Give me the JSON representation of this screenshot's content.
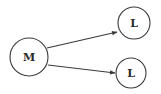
{
  "diagram": {
    "type": "directed-graph",
    "nodes": [
      {
        "id": "m",
        "label": "M",
        "cx": 29,
        "cy": 57,
        "r": 19
      },
      {
        "id": "l1",
        "label": "L",
        "cx": 134,
        "cy": 23,
        "r": 16
      },
      {
        "id": "l2",
        "label": "L",
        "cx": 131,
        "cy": 73,
        "r": 15
      }
    ],
    "edges": [
      {
        "from": "m",
        "to": "l1",
        "x1": 47,
        "y1": 48,
        "x2": 117,
        "y2": 32
      },
      {
        "from": "m",
        "to": "l2",
        "x1": 48,
        "y1": 65,
        "x2": 115,
        "y2": 73
      }
    ],
    "colors": {
      "stroke": "#3a3a3a",
      "background": "#ffffff"
    }
  }
}
